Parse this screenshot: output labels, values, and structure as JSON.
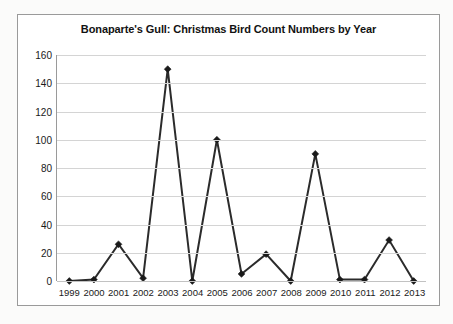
{
  "chart": {
    "title": "Bonaparte's Gull: Christmas Bird Count Numbers by Year",
    "frame_border_color": "#9a9a9a",
    "gridline_color": "#d4d4d4",
    "series_color": "#2b2b2b",
    "background_color": "#ffffff"
  },
  "chart_data": {
    "type": "line",
    "title": "Bonaparte's Gull: Christmas Bird Count Numbers by Year",
    "xlabel": "",
    "ylabel": "",
    "categories": [
      "1999",
      "2000",
      "2001",
      "2002",
      "2003",
      "2004",
      "2005",
      "2006",
      "2007",
      "2008",
      "2009",
      "2010",
      "2011",
      "2012",
      "2013"
    ],
    "values": [
      0,
      1,
      26,
      2,
      150,
      0,
      100,
      5,
      19,
      0,
      90,
      1,
      1,
      29,
      0
    ],
    "series": [
      {
        "name": "Bonaparte's Gull count",
        "values": [
          0,
          1,
          26,
          2,
          150,
          0,
          100,
          5,
          19,
          0,
          90,
          1,
          1,
          29,
          0
        ]
      }
    ],
    "ylim": [
      0,
      160
    ],
    "yticks": [
      0,
      20,
      40,
      60,
      80,
      100,
      120,
      140,
      160
    ],
    "ytick_labels": [
      "0",
      "20",
      "40",
      "60",
      "80",
      "100",
      "120",
      "140",
      "160"
    ],
    "grid": true,
    "grid_axis": "y",
    "legend": false,
    "legend_position": "none",
    "marker": "diamond",
    "line_width": 2,
    "line_color": "#2b2b2b",
    "marker_color": "#1a1a1a"
  }
}
